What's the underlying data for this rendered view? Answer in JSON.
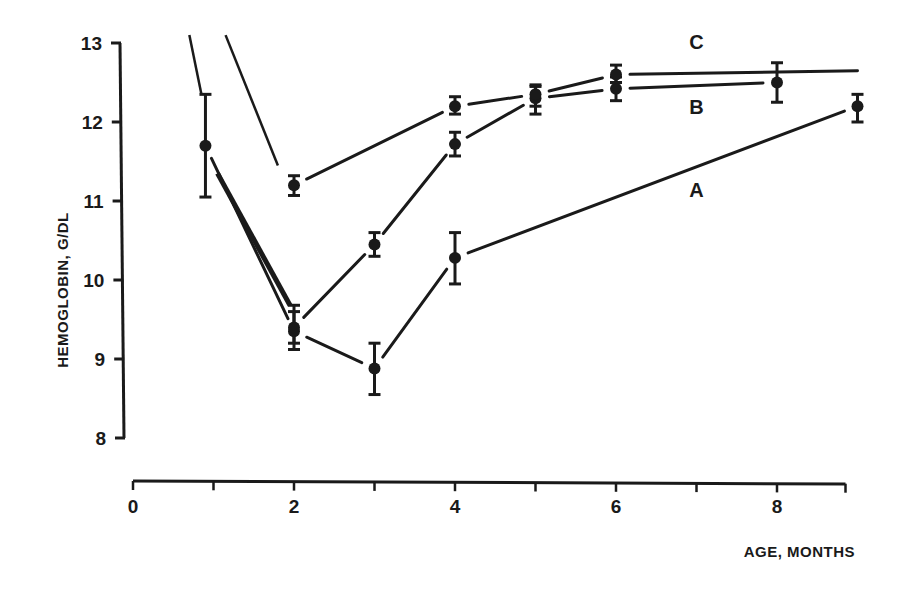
{
  "chart_data": {
    "type": "line",
    "title": "",
    "xlabel": "AGE, MONTHS",
    "ylabel": "HEMOGLOBIN, G/DL",
    "xlim": [
      0,
      9
    ],
    "ylim": [
      8,
      13
    ],
    "x_ticks": [
      0,
      2,
      4,
      6,
      8
    ],
    "x_tick_labels": [
      "0",
      "2",
      "4",
      "6",
      "8"
    ],
    "x_minor_ticks": [
      1,
      3,
      5,
      7,
      9
    ],
    "y_ticks": [
      8,
      9,
      10,
      11,
      12,
      13
    ],
    "y_tick_labels": [
      "8",
      "9",
      "10",
      "11",
      "12",
      "13"
    ],
    "grid": false,
    "legend": "inline labels A, B, C at right of curves",
    "series": [
      {
        "name": "A",
        "label_pos": {
          "x": 7.0,
          "y": 11.05
        },
        "x": [
          0.9,
          2,
          3,
          4,
          9
        ],
        "values": [
          11.7,
          9.35,
          8.88,
          10.28,
          12.2
        ],
        "err_low": [
          11.05,
          9.12,
          8.55,
          9.95,
          12.0
        ],
        "err_high": [
          12.35,
          9.6,
          9.2,
          10.6,
          12.35
        ],
        "lead_in": {
          "from": [
            0.7,
            13.1
          ],
          "to": [
            0.85,
            12.35
          ]
        }
      },
      {
        "name": "B",
        "label_pos": {
          "x": 7.0,
          "y": 12.1
        },
        "x": [
          2,
          3,
          4,
          5,
          6,
          8
        ],
        "values": [
          9.4,
          10.45,
          11.72,
          12.3,
          12.42,
          12.5
        ],
        "err_low": [
          9.2,
          10.3,
          11.57,
          12.1,
          12.27,
          12.25
        ],
        "err_high": [
          9.68,
          10.6,
          11.87,
          12.45,
          12.57,
          12.75
        ],
        "lead_in": {
          "from": [
            1.05,
            11.35
          ],
          "to": [
            1.95,
            9.68
          ],
          "thick": true
        }
      },
      {
        "name": "C",
        "label_pos": {
          "x": 7.0,
          "y": 12.92
        },
        "x": [
          2,
          4,
          5,
          6,
          9
        ],
        "values": [
          11.2,
          12.2,
          12.35,
          12.6,
          12.65
        ],
        "err_low": [
          11.07,
          12.1,
          12.2,
          12.5,
          null
        ],
        "err_high": [
          11.32,
          12.32,
          12.47,
          12.72,
          null
        ],
        "lead_in": {
          "from": [
            1.15,
            13.1
          ],
          "to": [
            1.8,
            11.45
          ]
        }
      }
    ]
  }
}
